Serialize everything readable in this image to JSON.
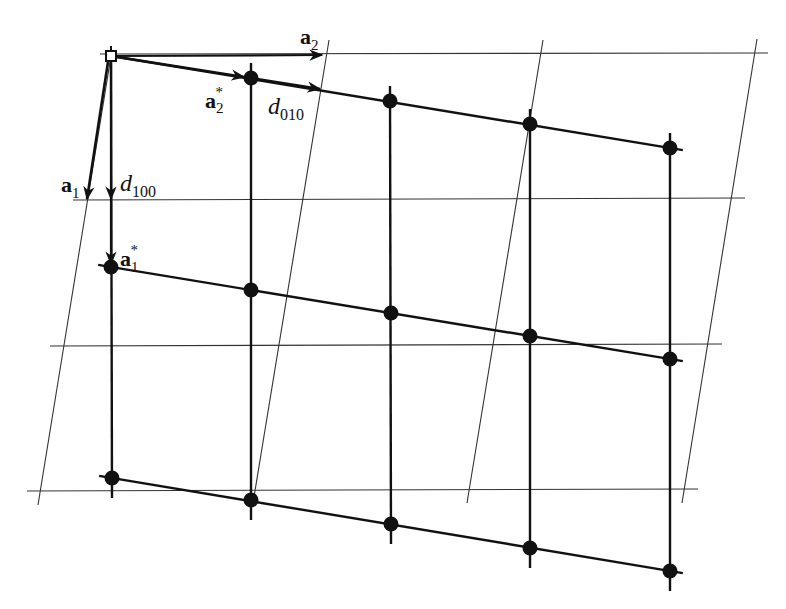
{
  "figure": {
    "colors": {
      "ink": "#111111",
      "thin_line": "#333333",
      "background": "#ffffff"
    }
  },
  "labels": {
    "a2": {
      "base": "a",
      "sub": "2",
      "sup": ""
    },
    "a2_star": {
      "base": "a",
      "sub": "2",
      "sup": "*"
    },
    "d010": {
      "base": "d",
      "sub": "010",
      "sup": ""
    },
    "a1": {
      "base": "a",
      "sub": "1",
      "sup": ""
    },
    "d100": {
      "base": "d",
      "sub": "100",
      "sup": ""
    },
    "a1_star": {
      "base": "a",
      "sub": "1",
      "sup": "*"
    }
  },
  "direct_lattice": {
    "horizontal_lines": [
      {
        "x1": 100,
        "y1": 54,
        "x2": 768,
        "y2": 53
      },
      {
        "x1": 73,
        "y1": 200,
        "x2": 745,
        "y2": 198
      },
      {
        "x1": 50,
        "y1": 346,
        "x2": 722,
        "y2": 344
      },
      {
        "x1": 27,
        "y1": 491,
        "x2": 698,
        "y2": 489
      }
    ],
    "slanted_lines": [
      {
        "x1": 111,
        "y1": 56,
        "x2": 38,
        "y2": 505
      },
      {
        "x1": 329,
        "y1": 40,
        "x2": 253,
        "y2": 503
      },
      {
        "x1": 543,
        "y1": 40,
        "x2": 467,
        "y2": 503
      },
      {
        "x1": 757,
        "y1": 39,
        "x2": 682,
        "y2": 503
      }
    ]
  },
  "reciprocal_lattice": {
    "points": [
      [
        [
          111,
          56
        ],
        [
          251,
          78
        ],
        [
          390,
          101
        ],
        [
          530,
          124
        ],
        [
          670,
          148
        ]
      ],
      [
        [
          111,
          267
        ],
        [
          251,
          290
        ],
        [
          391,
          313
        ],
        [
          530,
          336
        ],
        [
          670,
          359
        ]
      ],
      [
        [
          112,
          478
        ],
        [
          251,
          500
        ],
        [
          391,
          524
        ],
        [
          530,
          548
        ],
        [
          670,
          571
        ]
      ]
    ],
    "origin_marker": "open-square"
  }
}
